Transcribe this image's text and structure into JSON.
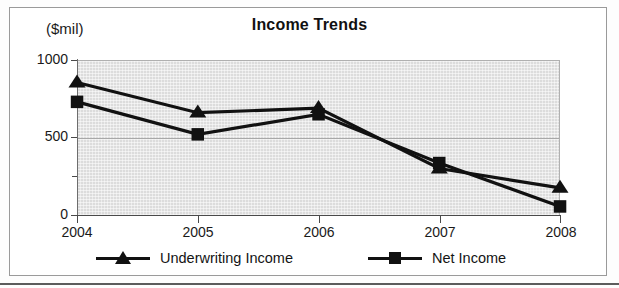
{
  "chart_data": {
    "type": "line",
    "title": "Income Trends",
    "xlabel": "",
    "ylabel": "($mil)",
    "categories": [
      "2004",
      "2005",
      "2006",
      "2007",
      "2008"
    ],
    "series": [
      {
        "name": "Underwriting Income",
        "marker": "triangle",
        "values": [
          855,
          660,
          690,
          300,
          175
        ]
      },
      {
        "name": "Net Income",
        "marker": "square",
        "values": [
          730,
          520,
          650,
          335,
          55
        ]
      }
    ],
    "ylim": [
      0,
      1000
    ],
    "yticks": [
      0,
      500,
      1000
    ],
    "ytick_labels": [
      "0",
      "500",
      "1000"
    ],
    "yminor_ticks": [
      250,
      750
    ],
    "grid": true,
    "legend_position": "bottom",
    "plot_background_color": "#dcdcdc",
    "series_color": "#111111"
  },
  "axis": {
    "unit_label": "($mil)",
    "y_labels": [
      "1000",
      "500",
      "0"
    ],
    "x_labels": [
      "2004",
      "2005",
      "2006",
      "2007",
      "2008"
    ]
  },
  "legend": {
    "items": [
      {
        "label": "Underwriting Income",
        "marker": "triangle-marker"
      },
      {
        "label": "Net Income",
        "marker": "square-marker"
      }
    ]
  }
}
